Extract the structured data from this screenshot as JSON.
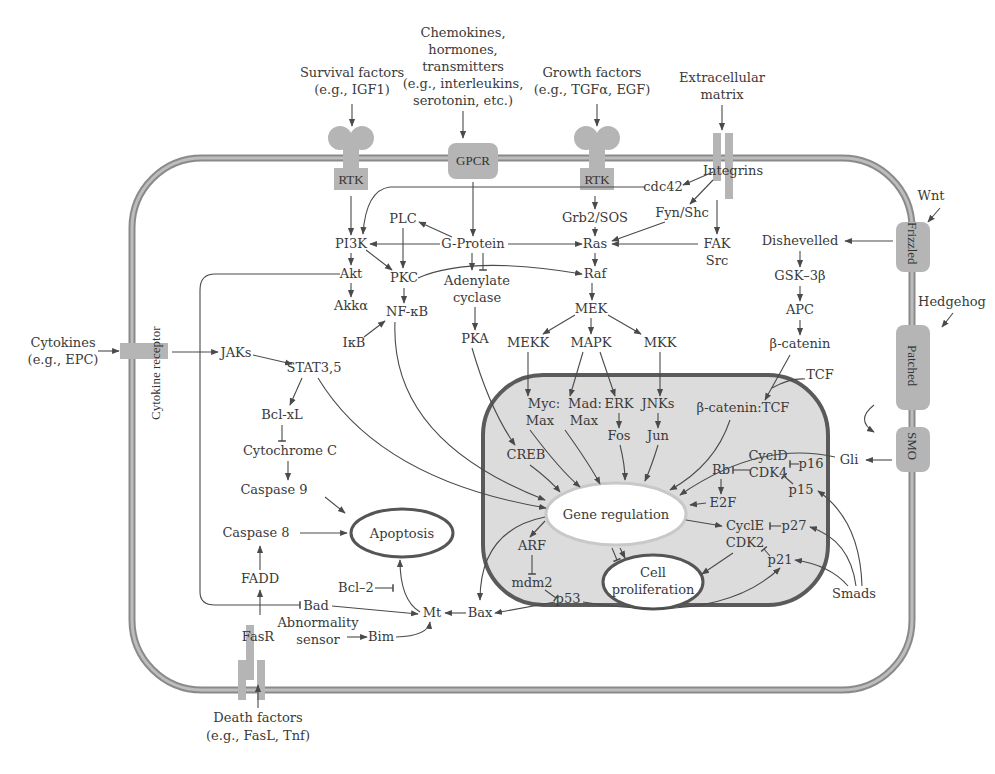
{
  "figure": {
    "colors": {
      "membrane": "#8a8a8a",
      "nucleus_fill": "#dcdcdc",
      "nucleus_border": "#5a5a5a",
      "receptor": "#b5b5b5",
      "text": "#3a3a3a"
    }
  },
  "external_signals": {
    "survival": [
      "Survival factors",
      "(e.g., IGF1)"
    ],
    "chemokines": [
      "Chemokines,",
      "hormones,",
      "transmitters",
      "(e.g., interleukins,",
      "serotonin, etc.)"
    ],
    "growth": [
      "Growth factors",
      "(e.g., TGFα, EGF)"
    ],
    "ecm": [
      "Extracellular",
      "matrix"
    ],
    "wnt": "Wnt",
    "hedgehog": "Hedgehog",
    "cytokines": [
      "Cytokines",
      "(e.g., EPC)"
    ],
    "death": [
      "Death factors",
      "(e.g., FasL, Tnf)"
    ]
  },
  "receptors": {
    "rtk1": "RTK",
    "gpcr": "GPCR",
    "rtk2": "RTK",
    "integrins": "Integrins",
    "frizzled": "Frizzled",
    "patched": "Patched",
    "smo": "SMO",
    "cytokine_receptor": "Cytokine receptor",
    "fasr": "FasR"
  },
  "cytoplasm": {
    "cdc42": "cdc42",
    "pi3k": "PI3K",
    "plc": "PLC",
    "gprotein": "G-Protein",
    "grb2": "Grb2/SOS",
    "fynshc": "Fyn/Shc",
    "ras": "Ras",
    "fak": "FAK",
    "src": "Src",
    "akt": "Akt",
    "pkc": "PKC",
    "adenylate": [
      "Adenylate",
      "cyclase"
    ],
    "raf": "Raf",
    "akka": "Akkα",
    "nfkb": "NF-κB",
    "ikb": "IκB",
    "pka": "PKA",
    "mek": "MEK",
    "mekk": "MEKK",
    "mapk": "MAPK",
    "mkk": "MKK",
    "dishevelled": "Dishevelled",
    "gsk3b": "GSK–3β",
    "apc": "APC",
    "bcatenin": "β-catenin",
    "tcf": "TCF",
    "jaks": "JAKs",
    "stat": "STAT3,5",
    "bclxl": "Bcl-xL",
    "cytc": "Cytochrome C",
    "casp9": "Caspase 9",
    "casp8": "Caspase 8",
    "apoptosis": "Apoptosis",
    "fadd": "FADD",
    "bcl2": "Bcl–2",
    "bad": "Bad",
    "mt": "Mt",
    "bax": "Bax",
    "abnormality": [
      "Abnormality",
      "sensor"
    ],
    "bim": "Bim",
    "smads": "Smads",
    "gli": "Gli"
  },
  "nucleus": {
    "myc": [
      "Myc:",
      "Max"
    ],
    "mad": [
      "Mad:",
      "Max"
    ],
    "erk": "ERK",
    "fos": "Fos",
    "jnks": "JNKs",
    "jun": "Jun",
    "bcat_tcf": "β-catenin:TCF",
    "creb": "CREB",
    "gene_regulation": "Gene regulation",
    "cycd": "CyclD",
    "cdk4": "CDK4",
    "rb": "Rb",
    "p16": "p16",
    "p15": "p15",
    "e2f": "E2F",
    "cyce": "CyclE",
    "cdk2": "CDK2",
    "p27": "p27",
    "p21": "p21",
    "arf": "ARF",
    "mdm2": "mdm2",
    "p53": "p53",
    "cell_prolif": [
      "Cell",
      "proliferation"
    ]
  }
}
